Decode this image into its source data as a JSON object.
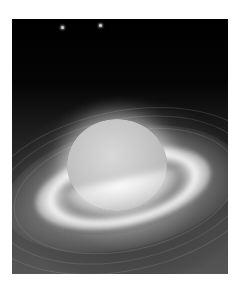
{
  "image": {
    "subject": "ringed planet in space",
    "palette": [
      "#000000",
      "#2a2a2a",
      "#555555",
      "#c6c6c6",
      "#ffffff"
    ],
    "frame": {
      "x": 12,
      "y": 19,
      "width": 216,
      "height": 255
    }
  },
  "stars": [
    {
      "x": 62,
      "y": 28
    },
    {
      "x": 100,
      "y": 26
    }
  ]
}
